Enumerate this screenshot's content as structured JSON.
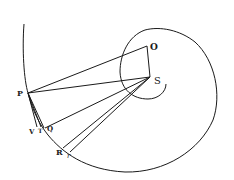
{
  "diagram": {
    "kind": "geometric-figure",
    "stroke_color": "#1a1a1a",
    "background": "#ffffff",
    "points": {
      "P": {
        "label": "P",
        "x": 28,
        "y": 93
      },
      "O": {
        "label": "O",
        "x": 147,
        "y": 46
      },
      "S": {
        "label": "S",
        "x": 150,
        "y": 77
      },
      "V": {
        "label": "V",
        "x": 37,
        "y": 127
      },
      "T": {
        "label": "T",
        "x": 41,
        "y": 127
      },
      "Q": {
        "label": "Q",
        "x": 45,
        "y": 128
      },
      "R": {
        "label": "R",
        "x": 63,
        "y": 148
      },
      "r": {
        "label": "r",
        "x": 70,
        "y": 152
      }
    },
    "segments": [
      [
        "P",
        "O"
      ],
      [
        "O",
        "S"
      ],
      [
        "P",
        "S"
      ],
      [
        "S",
        "Q"
      ],
      [
        "S",
        "R"
      ],
      [
        "S",
        "r"
      ],
      [
        "P",
        "V"
      ],
      [
        "P",
        "T"
      ],
      [
        "P",
        "Q"
      ],
      [
        "V",
        "Q"
      ]
    ],
    "curves": [
      "outer-spiral-arc",
      "inner-spiral-loop"
    ]
  }
}
